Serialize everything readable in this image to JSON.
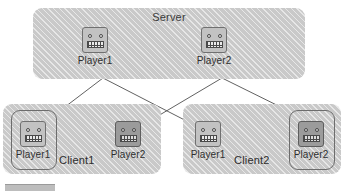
{
  "diagram": {
    "title_server": "Server",
    "server": {
      "label": "Server",
      "players": [
        {
          "caption": "Player1",
          "icon": "robot-icon",
          "shade": "light"
        },
        {
          "caption": "Player2",
          "icon": "robot-icon",
          "shade": "light"
        }
      ]
    },
    "clients": [
      {
        "label": "Client1",
        "players": [
          {
            "caption": "Player1",
            "icon": "robot-icon",
            "shade": "light",
            "owned": true
          },
          {
            "caption": "Player2",
            "icon": "robot-icon",
            "shade": "dark",
            "owned": false
          }
        ]
      },
      {
        "label": "Client2",
        "players": [
          {
            "caption": "Player1",
            "icon": "robot-icon",
            "shade": "light",
            "owned": false
          },
          {
            "caption": "Player2",
            "icon": "robot-icon",
            "shade": "dark",
            "owned": true
          }
        ]
      }
    ],
    "links": [
      {
        "from": "server.Player1",
        "to": "client1.Player1"
      },
      {
        "from": "server.Player1",
        "to": "client2.Player1"
      },
      {
        "from": "server.Player2",
        "to": "client1.Player2"
      },
      {
        "from": "server.Player2",
        "to": "client2.Player2"
      }
    ],
    "colors": {
      "panel_fill": "#c9c9c9",
      "robot_light": "#c2c2c2",
      "robot_dark": "#9b9b9b",
      "line": "#4f4f4f",
      "text": "#2f2f2f",
      "caption_bar": "#bdbdbd"
    }
  }
}
